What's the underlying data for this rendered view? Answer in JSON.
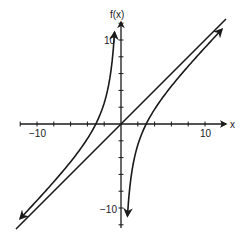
{
  "chart_data": {
    "type": "line",
    "title": "",
    "xlabel": "x",
    "ylabel": "f(x)",
    "xlim": [
      -12.5,
      12.5
    ],
    "ylim": [
      -12.5,
      12.5
    ],
    "x_ticks_step": 2,
    "y_ticks_step": 2,
    "x_tick_labels": [
      {
        "value": -10,
        "label": "−10"
      },
      {
        "value": 10,
        "label": "10"
      }
    ],
    "y_tick_labels": [
      {
        "value": 10,
        "label": "10"
      },
      {
        "value": -10,
        "label": "−10"
      }
    ],
    "grid": false,
    "legend": null,
    "series": [
      {
        "name": "f(x)",
        "description": "rational function with vertical asymptote x = 0 and oblique asymptote y = x; x-intercepts at -3 and 3",
        "x_intercepts": [
          -3,
          3
        ],
        "branches": [
          {
            "x": [
              -12,
              -10,
              -8,
              -6,
              -4,
              -3,
              -2,
              -1.5,
              -1,
              -0.8
            ],
            "y": [
              -11.25,
              -9.1,
              -6.875,
              -4.5,
              -1.75,
              0,
              2.5,
              4.5,
              8,
              10.45
            ]
          },
          {
            "x": [
              0.8,
              1,
              1.5,
              2,
              3,
              4,
              6,
              8,
              10,
              12
            ],
            "y": [
              -10.45,
              -8,
              -4.5,
              -2.5,
              0,
              1.75,
              4.5,
              6.875,
              9.1,
              11.25
            ]
          }
        ]
      },
      {
        "name": "asymptote y = x",
        "x": [
          -12.5,
          12.5
        ],
        "y": [
          -12.5,
          12.5
        ]
      }
    ]
  },
  "axes": {
    "x_label": "x",
    "y_label": "f(x)",
    "x_neg_label": "−10",
    "x_pos_label": "10",
    "y_pos_label": "10",
    "y_neg_label": "−10"
  }
}
